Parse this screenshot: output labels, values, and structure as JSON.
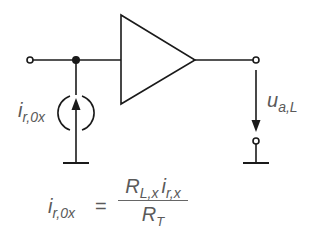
{
  "diagram": {
    "type": "circuit",
    "components": {
      "amplifier": {
        "symbol": "triangle",
        "role": "amplifier"
      },
      "current_source": {
        "symbol": "noise-current-source",
        "direction": "up"
      },
      "input_terminal": {
        "symbol": "open-circle"
      },
      "output_terminal": {
        "symbol": "open-circle"
      },
      "output_ground_terminal": {
        "symbol": "open-circle"
      },
      "junction": {
        "symbol": "filled-dot"
      },
      "grounds": [
        "input-side-ground",
        "output-side-ground"
      ]
    },
    "labels": {
      "current_source": {
        "main": "i",
        "sub": "r,0x"
      },
      "output_voltage": {
        "main": "u",
        "sub": "a,L"
      }
    },
    "formula": {
      "lhs": {
        "main": "i",
        "sub": "r,0x"
      },
      "equals": "=",
      "numerator": [
        {
          "main": "R",
          "sub": "L,x"
        },
        {
          "main": "i",
          "sub": "r,x"
        }
      ],
      "denominator": {
        "main": "R",
        "sub": "T"
      }
    },
    "colors": {
      "stroke": "#1a1a1a",
      "text": "#5a5a5a",
      "background": "#ffffff"
    }
  }
}
